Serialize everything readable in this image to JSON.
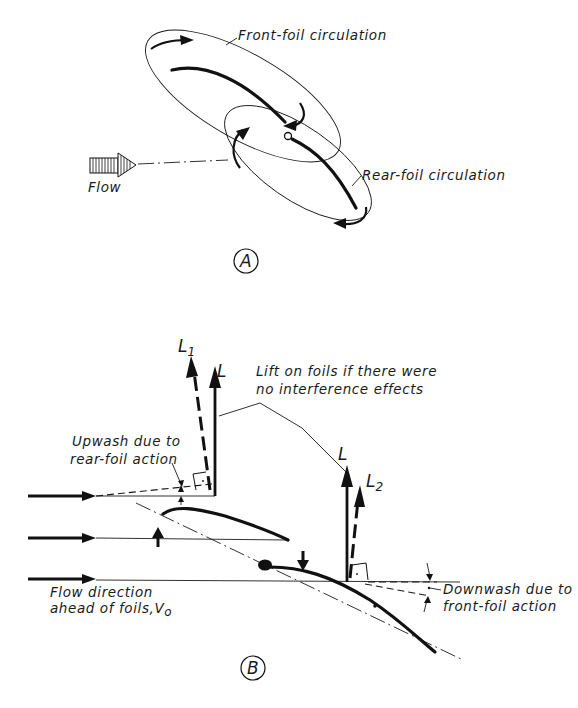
{
  "figure_a": {
    "label": "A",
    "front_foil_label": "Front-foil circulation",
    "rear_foil_label": "Rear-foil circulation",
    "flow_label": "Flow"
  },
  "figure_b": {
    "label": "B",
    "lift_l1": "L",
    "lift_l1_sub": "1",
    "lift_l_front": "L",
    "lift_l_rear": "L",
    "lift_l2": "L",
    "lift_l2_sub": "2",
    "lift_note_line1": "Lift on foils if there were",
    "lift_note_line2": "no interference effects",
    "upwash_line1": "Upwash due to",
    "upwash_line2": "rear-foil action",
    "downwash_line1": "Downwash due to",
    "downwash_line2": "front-foil action",
    "flow_dir_line1": "Flow direction",
    "flow_dir_line2": "ahead of foils,V",
    "flow_dir_sub": "o"
  }
}
